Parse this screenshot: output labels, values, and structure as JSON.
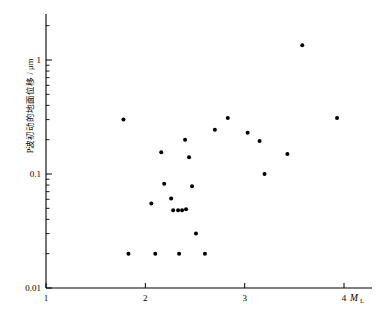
{
  "chart_data": {
    "type": "scatter",
    "title": "",
    "xlabel": "M_L",
    "ylabel": "P波初动的地面位移 / μm",
    "xscale": "linear",
    "yscale": "log",
    "xlim": [
      1,
      4.35
    ],
    "ylim": [
      0.01,
      2.0
    ],
    "grid": false,
    "legend": null,
    "xticks": [
      1,
      2,
      3,
      4
    ],
    "xticklabels": [
      "1",
      "2",
      "3",
      "4"
    ],
    "yticks": [
      0.01,
      0.1,
      1
    ],
    "yticklabels": [
      "0.01",
      "0.1",
      "1"
    ],
    "yminorticks": [
      0.02,
      0.03,
      0.04,
      0.05,
      0.06,
      0.07,
      0.08,
      0.09,
      0.2,
      0.3,
      0.4,
      0.5,
      0.6,
      0.7,
      0.8,
      0.9,
      2
    ],
    "marker": "filled-circle",
    "marker_color": "#000000",
    "marker_size_px": 4,
    "points": [
      {
        "x": 1.78,
        "y": 0.3
      },
      {
        "x": 1.83,
        "y": 0.02
      },
      {
        "x": 2.06,
        "y": 0.055
      },
      {
        "x": 2.1,
        "y": 0.02
      },
      {
        "x": 2.16,
        "y": 0.155
      },
      {
        "x": 2.19,
        "y": 0.082
      },
      {
        "x": 2.26,
        "y": 0.061
      },
      {
        "x": 2.28,
        "y": 0.048
      },
      {
        "x": 2.33,
        "y": 0.048
      },
      {
        "x": 2.34,
        "y": 0.02
      },
      {
        "x": 2.37,
        "y": 0.048
      },
      {
        "x": 2.4,
        "y": 0.2
      },
      {
        "x": 2.41,
        "y": 0.049
      },
      {
        "x": 2.44,
        "y": 0.14
      },
      {
        "x": 2.47,
        "y": 0.078
      },
      {
        "x": 2.51,
        "y": 0.03
      },
      {
        "x": 2.6,
        "y": 0.02
      },
      {
        "x": 2.7,
        "y": 0.245
      },
      {
        "x": 2.83,
        "y": 0.31
      },
      {
        "x": 3.03,
        "y": 0.23
      },
      {
        "x": 3.15,
        "y": 0.195
      },
      {
        "x": 3.2,
        "y": 0.1
      },
      {
        "x": 3.43,
        "y": 0.15
      },
      {
        "x": 3.58,
        "y": 1.35
      },
      {
        "x": 3.93,
        "y": 0.31
      }
    ],
    "axis_color": "#000000",
    "background": "#ffffff"
  },
  "geometry": {
    "x_px_at_1": 46,
    "x_px_at_4": 344,
    "y_px_at_1": 34,
    "y_px_at_0p1": 174,
    "y_px_at_0p01": 288,
    "axis_top_px": 14,
    "axis_right_px": 372
  }
}
